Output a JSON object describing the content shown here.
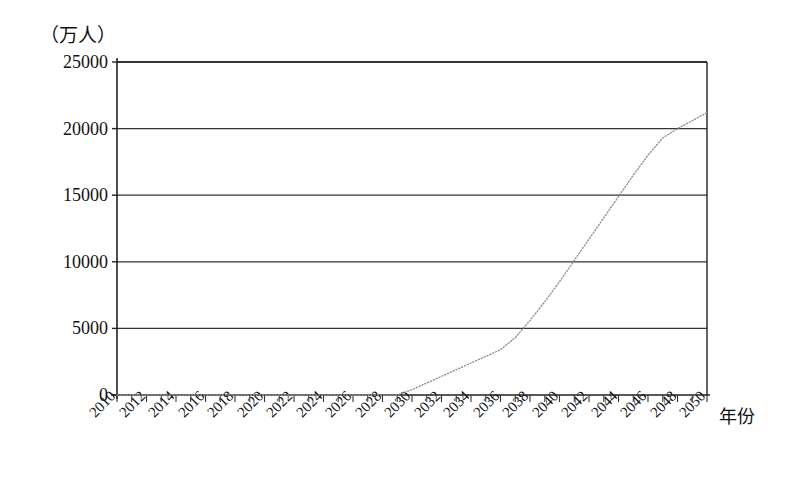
{
  "chart_data": {
    "type": "line",
    "title": "",
    "subtitle": "",
    "ylabel": "（万人）",
    "xlabel": "年份",
    "ylim": [
      0,
      25000
    ],
    "xlim": [
      2010,
      2050
    ],
    "grid": "horizontal",
    "legend": "none",
    "y_ticks": [
      0,
      5000,
      10000,
      15000,
      20000,
      25000
    ],
    "y_tick_labels": [
      "0",
      "5000",
      "10000",
      "15000",
      "20000",
      "25000"
    ],
    "x_tick_labels": [
      "2010",
      "2012",
      "2014",
      "2016",
      "2018",
      "2020",
      "2022",
      "2024",
      "2026",
      "2028",
      "2030",
      "2032",
      "2034",
      "2036",
      "2038",
      "2040",
      "2042",
      "2044",
      "2046",
      "2048",
      "2050"
    ],
    "x_minor_tick_step": 1,
    "series": [
      {
        "name": "",
        "style": "dotted",
        "color": "#8d8d8d",
        "x": [
          2010,
          2012,
          2014,
          2016,
          2018,
          2020,
          2022,
          2024,
          2026,
          2028,
          2029,
          2030,
          2031,
          2032,
          2033,
          2034,
          2035,
          2036,
          2037,
          2038,
          2039,
          2040,
          2041,
          2042,
          2043,
          2044,
          2045,
          2046,
          2047,
          2048,
          2049,
          2050
        ],
        "values": [
          0,
          0,
          0,
          0,
          0,
          0,
          0,
          0,
          0,
          0,
          0,
          400,
          900,
          1400,
          1900,
          2400,
          2900,
          3400,
          4300,
          5600,
          7000,
          8500,
          10100,
          11700,
          13300,
          14900,
          16500,
          18000,
          19300,
          20000,
          20600,
          21200
        ]
      }
    ],
    "annotations": []
  }
}
